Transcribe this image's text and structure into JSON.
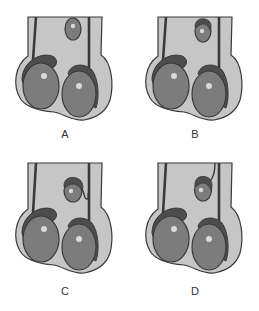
{
  "figure": {
    "colors": {
      "background": "#ffffff",
      "body_fill": "#c6c6c6",
      "outline": "#3a3a3a",
      "testis_fill": "#7c7c7c",
      "epididymis_fill": "#4d4d4d",
      "highlight": "#d9d9d9",
      "label": "#333333"
    },
    "panels": [
      {
        "id": "A",
        "label": "A",
        "upper_structure": "plain-oval"
      },
      {
        "id": "B",
        "label": "B",
        "upper_structure": "oval-with-cap"
      },
      {
        "id": "C",
        "label": "C",
        "upper_structure": "oval-with-cap-and-twisted-stalk"
      },
      {
        "id": "D",
        "label": "D",
        "upper_structure": "oval-with-cap-and-stalk"
      }
    ]
  }
}
